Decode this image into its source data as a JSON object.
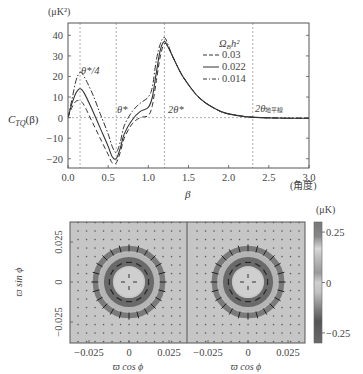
{
  "chart_data": [
    {
      "type": "line",
      "title": "",
      "xlabel": "β",
      "xlabel_unit": "(角度)",
      "ylabel": "C_TQ(β)",
      "ylabel_unit": "(μK²)",
      "xlim": [
        0.0,
        3.0
      ],
      "ylim": [
        -24.5,
        46
      ],
      "xticks": [
        0.0,
        0.5,
        1.0,
        1.5,
        2.0,
        2.5,
        3.0
      ],
      "xtick_labels": [
        "0.0",
        "0.5",
        "1.0",
        "1.5",
        "2.0",
        "2.5",
        "3.0"
      ],
      "yticks": [
        40,
        30,
        20,
        10,
        0,
        -10,
        -20
      ],
      "ytick_labels": [
        "40",
        "30",
        "20",
        "10",
        "0",
        "−10",
        "−20"
      ],
      "grid": false,
      "legend": {
        "title": "Ω_B h²",
        "placement": "top-right",
        "entries": [
          {
            "label": "0.03",
            "style": "dashed"
          },
          {
            "label": "0.022",
            "style": "solid"
          },
          {
            "label": "0.014",
            "style": "dashdot"
          }
        ]
      },
      "reference_lines": [
        {
          "x": 0.15,
          "label": "θ*/4"
        },
        {
          "x": 0.6,
          "label": "θ*"
        },
        {
          "x": 1.2,
          "label": "2θ*"
        },
        {
          "x": 2.3,
          "label": "2θ地平線"
        },
        {
          "y": 0,
          "label": ""
        }
      ],
      "x": [
        0.0,
        0.05,
        0.1,
        0.15,
        0.2,
        0.3,
        0.4,
        0.5,
        0.55,
        0.6,
        0.65,
        0.7,
        0.8,
        0.9,
        1.0,
        1.05,
        1.1,
        1.15,
        1.2,
        1.25,
        1.3,
        1.4,
        1.5,
        1.6,
        1.7,
        1.8,
        1.9,
        2.0,
        2.2,
        2.4,
        2.6,
        2.8,
        3.0
      ],
      "series": [
        {
          "name": "0.03",
          "style": "dashed",
          "values": [
            0,
            5,
            8,
            8,
            6,
            -2,
            -10,
            -18,
            -22,
            -22,
            -17,
            -10,
            -3,
            0,
            1,
            6,
            18,
            30,
            36,
            34,
            30,
            22,
            16,
            11,
            7.5,
            5,
            3,
            1.8,
            0.5,
            0,
            -0.2,
            -0.3,
            -0.3
          ]
        },
        {
          "name": "0.022",
          "style": "solid",
          "values": [
            0,
            7,
            12,
            14,
            12,
            4,
            -5,
            -14,
            -19,
            -20,
            -15,
            -8,
            -1,
            3,
            5,
            10,
            22,
            33,
            37,
            34,
            30,
            22,
            16,
            11,
            7.5,
            5,
            3,
            1.8,
            0.5,
            0,
            -0.2,
            -0.3,
            -0.3
          ]
        },
        {
          "name": "0.014",
          "style": "dashdot",
          "values": [
            0,
            9,
            18,
            22,
            20,
            12,
            2,
            -8,
            -14,
            -17,
            -12,
            -4,
            3,
            7,
            10,
            15,
            28,
            36,
            39,
            35,
            30,
            22,
            16,
            11,
            7.5,
            5,
            3,
            1.8,
            0.5,
            0,
            -0.2,
            -0.3,
            -0.3
          ]
        }
      ]
    },
    {
      "type": "heatmap",
      "panels": 2,
      "xlabel": "ϖ cos ϕ",
      "ylabel": "ϖ sin ϕ",
      "xlim": [
        -0.032,
        0.032
      ],
      "ylim": [
        -0.032,
        0.032
      ],
      "xticks": [
        -0.025,
        0,
        0.025
      ],
      "xtick_labels": [
        "−0.025",
        "0",
        "0.025"
      ],
      "yticks": [
        0.025,
        0,
        -0.025
      ],
      "ytick_labels": [
        "0.025",
        "0",
        "−0.025"
      ],
      "colorbar": {
        "unit": "(μK)",
        "range": [
          -0.3,
          0.3
        ],
        "ticks": [
          0.25,
          0,
          -0.25
        ],
        "tick_labels": [
          "0.25",
          "0",
          "−0.25"
        ]
      },
      "features": {
        "inner_ring_radius": 0.011,
        "outer_ring_radius": 0.021,
        "inner_ring_vectors": "tangential",
        "outer_ring_vectors": "radial"
      }
    }
  ],
  "labels": {
    "top_yunit": "(μK²)",
    "top_ylabel": "C",
    "top_ylabel_sub": "TQ",
    "top_ylabel_arg": "(β)",
    "top_xlabel": "β",
    "top_xunit": "(角度)",
    "legend_title_main": "Ω",
    "legend_title_sub": "B",
    "legend_title_rest": "h²",
    "annot_q": "θ*/4",
    "annot_t": "θ*",
    "annot_2t": "2θ*",
    "annot_h": "2θ",
    "annot_h_sub": "地平線",
    "map_xlabel": "ϖ cos ϕ",
    "map_ylabel": "ϖ sin ϕ",
    "cbar_unit": "(μK)"
  }
}
